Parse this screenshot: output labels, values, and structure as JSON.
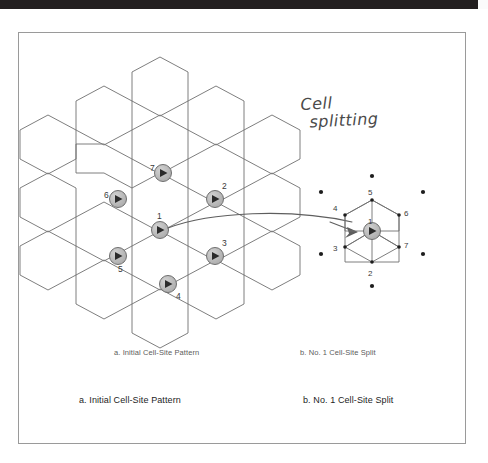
{
  "page": {
    "background_color": "#ffffff",
    "frame_border_color": "#9a9a9a",
    "scan_bar_color": "#231f20"
  },
  "annotation": {
    "handwritten_line1": "Cell",
    "handwritten_line2": "splitting",
    "ink_color": "#4a4a4a"
  },
  "captions": {
    "small": {
      "left": "a. Initial Cell-Site Pattern",
      "right": "b. No. 1 Cell-Site Split"
    },
    "large": {
      "left": "a. Initial Cell-Site Pattern",
      "right": "b. No. 1 Cell-Site Split"
    }
  },
  "figure": {
    "hex_stroke_color": "#6f6f6f",
    "site_fill_color": "#b5b5b5",
    "site_stroke_color": "#6f6f6f",
    "sector_color": "#2b2b2b",
    "arrow_color": "#5e5e5e",
    "dot_color": "#1d1d1d",
    "left_panel": {
      "name": "initial-cell-site-pattern",
      "site_labels": [
        "1",
        "2",
        "3",
        "4",
        "5",
        "6",
        "7"
      ],
      "sites": [
        {
          "label": "1",
          "x": 160,
          "y": 230,
          "label_x": 157,
          "label_y": 216
        },
        {
          "label": "2",
          "x": 215,
          "y": 199,
          "label_x": 222,
          "label_y": 186
        },
        {
          "label": "3",
          "x": 215,
          "y": 256,
          "label_x": 222,
          "label_y": 243
        },
        {
          "label": "4",
          "x": 168,
          "y": 284,
          "label_x": 176,
          "label_y": 296
        },
        {
          "label": "5",
          "x": 118,
          "y": 256,
          "label_x": 119,
          "label_y": 269
        },
        {
          "label": "6",
          "x": 118,
          "y": 199,
          "label_x": 106,
          "label_y": 195
        },
        {
          "label": "7",
          "x": 163,
          "y": 173,
          "label_x": 152,
          "label_y": 168
        }
      ]
    },
    "right_panel": {
      "name": "no-1-cell-site-split",
      "site_labels": [
        "1",
        "2",
        "3",
        "4",
        "5",
        "6",
        "7"
      ],
      "main_site": {
        "label": "1",
        "x": 372,
        "y": 231
      },
      "vertices": [
        {
          "label": "1",
          "x": 372,
          "y": 231,
          "label_x": 368,
          "label_y": 221
        },
        {
          "label": "2",
          "x": 372,
          "y": 262,
          "label_x": 368,
          "label_y": 274
        },
        {
          "label": "3",
          "x": 345,
          "y": 247,
          "label_x": 334,
          "label_y": 250
        },
        {
          "label": "4",
          "x": 345,
          "y": 215,
          "label_x": 334,
          "label_y": 208
        },
        {
          "label": "5",
          "x": 372,
          "y": 200,
          "label_x": 368,
          "label_y": 192
        },
        {
          "label": "6",
          "x": 399,
          "y": 215,
          "label_x": 404,
          "label_y": 214
        },
        {
          "label": "7",
          "x": 399,
          "y": 247,
          "label_x": 404,
          "label_y": 246
        }
      ],
      "outer_dots": [
        {
          "x": 372,
          "y": 176
        },
        {
          "x": 321,
          "y": 192
        },
        {
          "x": 423,
          "y": 192
        },
        {
          "x": 321,
          "y": 254
        },
        {
          "x": 423,
          "y": 254
        },
        {
          "x": 372,
          "y": 286
        }
      ]
    },
    "arrow": {
      "name": "cell-splitting-arrow",
      "from_label": "1",
      "to_label": "1"
    }
  }
}
